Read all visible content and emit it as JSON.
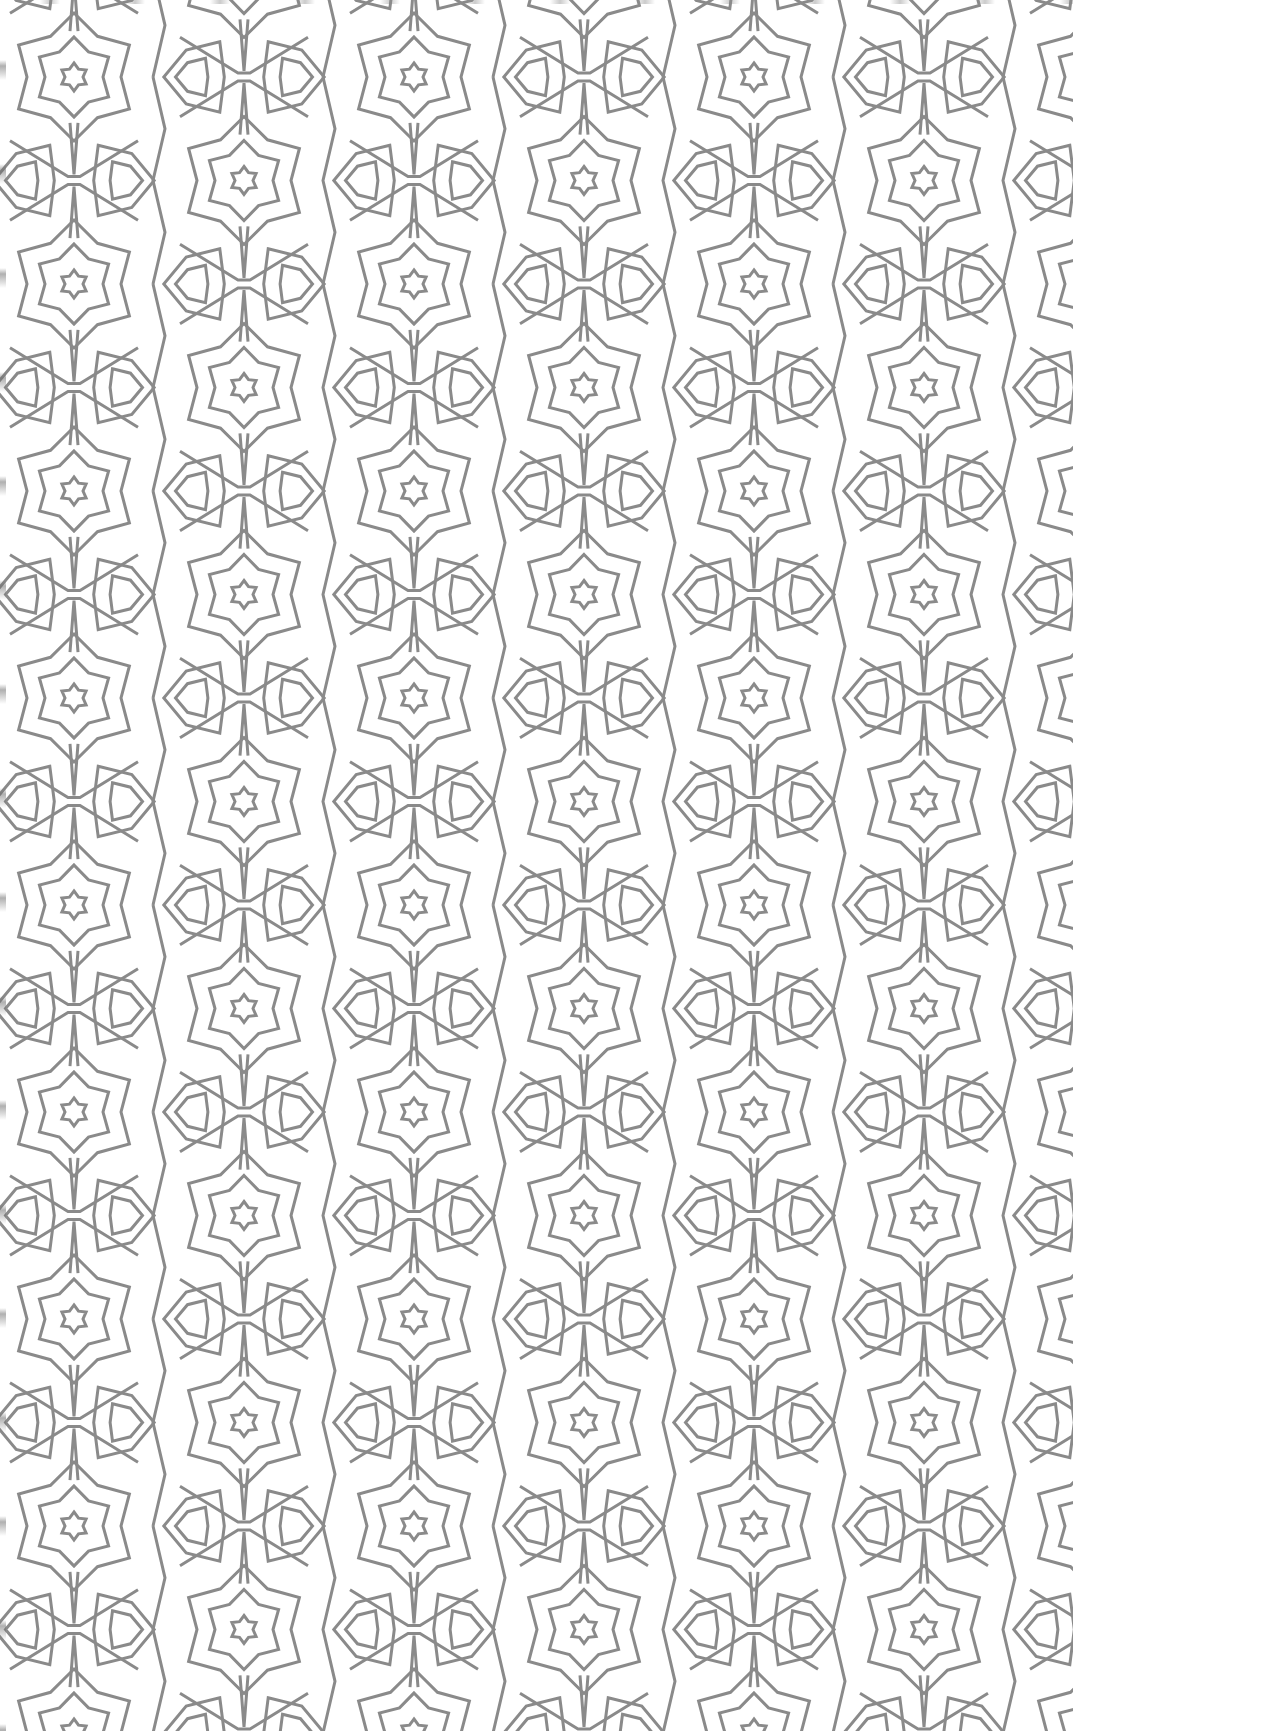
{
  "page": {
    "background_color": "#ffffff",
    "content": "geometric line pattern"
  },
  "pattern": {
    "motif": "six-pointed concentric stars with interlacing X crossings and D-shaped lozenges",
    "line_color": "#8a8a8a",
    "line_width": 3,
    "tile_width": 340,
    "tile_height": 207,
    "origin_x": 74,
    "origin_y": 77,
    "sheet_width": 1073
  }
}
